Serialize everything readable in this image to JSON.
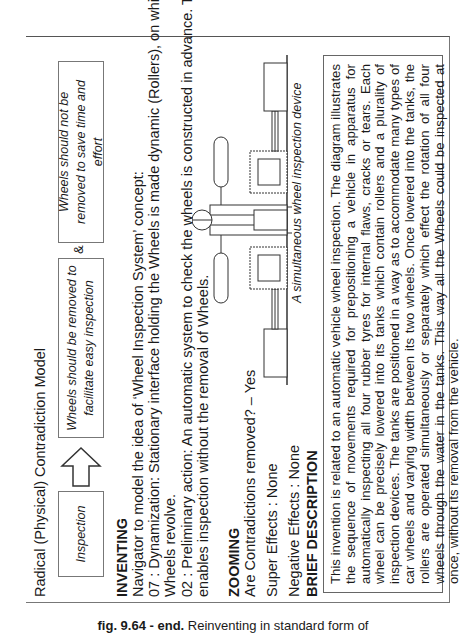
{
  "model": {
    "title": "Radical (Physical) Contradiction Model",
    "box_inspection": "Inspection",
    "box_removed": "Wheels should be removed to facilitate easy inspection",
    "ampersand": "&",
    "box_not_removed": "Wheels should not be removed to save time and effort",
    "arrow_icon": "up-arrow-outline"
  },
  "inventing": {
    "heading": "INVENTING",
    "lines": [
      "Navigator to model the idea of ‘Wheel Inspection System’ concept:",
      "07 : Dynamization: Stationary interface holding the Wheels is made dynamic (Rollers), on which",
      "Wheels revolve.",
      "02 : Preliminary action: An automatic system to check the wheels is constructed in advance. This",
      "enables inspection without the removal of Wheels."
    ]
  },
  "zooming": {
    "heading": "ZOOMING",
    "contradictions": "Are Contradictions removed? – Yes",
    "super_effects": "Super Effects : None",
    "negative_effects": "Negative Effects : None"
  },
  "diagram": {
    "caption": "A simultaneous wheel inspection device"
  },
  "brief": {
    "heading": "BRIEF DESCRIPTION",
    "text": "This invention is related to an automatic vehicle wheel inspection. The diagram illustrates the sequence of movements required for prepositioning a vehicle in apparatus for automatically inspecting all four rubber tyres for internal flaws, cracks or tears. Each wheel can be precisely lowered into its tanks which contain rollers and a plurality of inspection devices. The tanks are positioned in a way as to accommodate many types of car wheels and varying width between its two wheels. Once lowered into the tanks, the rollers are operated simultaneously or separately which effect the rotation of all four wheels through the water in the tanks. This way all the Wheels could be inspected at once, without its removal from the vehicle."
  },
  "figure_caption": {
    "label": "fig. 9.64 - end.",
    "text": " Reinventing in standard form of"
  }
}
